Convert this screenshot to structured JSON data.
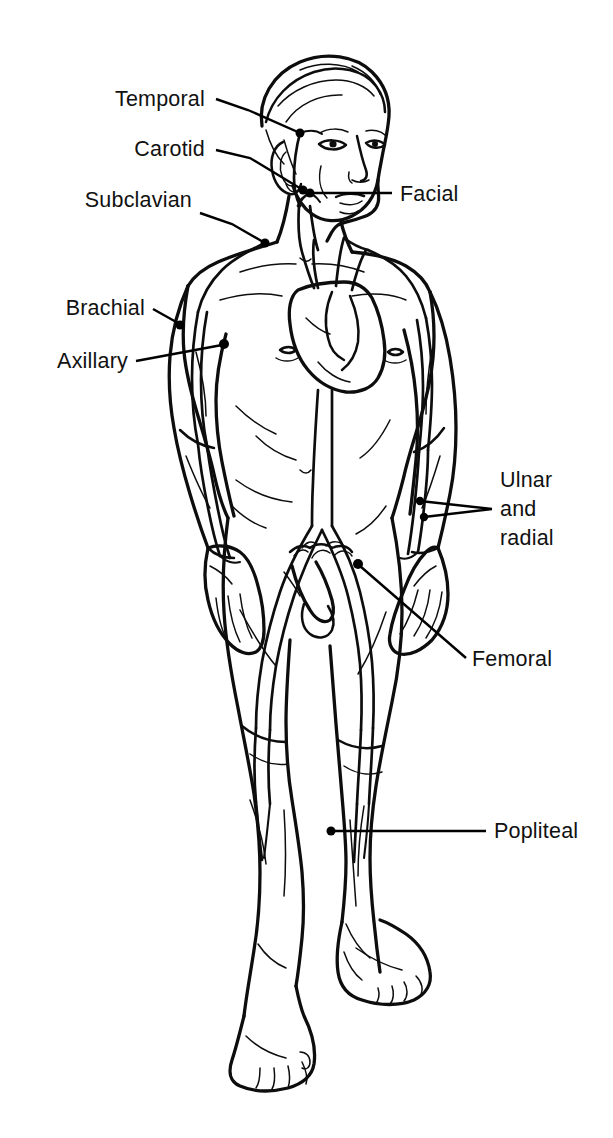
{
  "figure": {
    "background_color": "#ffffff",
    "line_color": "#0d0d0d",
    "label_color": "#111111"
  },
  "labels": [
    {
      "id": "temporal",
      "text": "Temporal",
      "side": "left",
      "text_x": 205,
      "text_y": 106,
      "anchor": "end",
      "leader": "M 216 99 L 248 110 L 300 133",
      "dot_x": 300,
      "dot_y": 133,
      "dot_r": 4.5
    },
    {
      "id": "carotid",
      "text": "Carotid",
      "side": "left",
      "text_x": 205,
      "text_y": 156,
      "anchor": "end",
      "leader": "M 216 150 L 250 158 L 303 190",
      "dot_x": 303,
      "dot_y": 190,
      "dot_r": 4.5
    },
    {
      "id": "facial",
      "text": "Facial",
      "side": "right",
      "text_x": 400,
      "text_y": 201,
      "anchor": "start",
      "leader": "M 392 193 L 310 193",
      "dot_x": 310,
      "dot_y": 193,
      "dot_r": 4.5
    },
    {
      "id": "subclavian",
      "text": "Subclavian",
      "side": "left",
      "text_x": 192,
      "text_y": 207,
      "anchor": "end",
      "leader": "M 200 213 L 232 224 L 265 243",
      "dot_x": 265,
      "dot_y": 243,
      "dot_r": 4.5
    },
    {
      "id": "brachial",
      "text": "Brachial",
      "side": "left",
      "text_x": 145,
      "text_y": 315,
      "anchor": "end",
      "leader": "M 153 309 L 178 323",
      "dot_x": 180,
      "dot_y": 325,
      "dot_r": 4.5
    },
    {
      "id": "axillary",
      "text": "Axillary",
      "side": "left",
      "text_x": 128,
      "text_y": 368,
      "anchor": "end",
      "leader": "M 136 361 L 222 345",
      "dot_x": 224,
      "dot_y": 344,
      "dot_r": 5.0
    },
    {
      "id": "ulnar-radial",
      "text": "Ulnar\nand\nradial",
      "lines": [
        "Ulnar",
        "and",
        "radial"
      ],
      "side": "right",
      "text_x": 500,
      "text_y": 487,
      "line_height": 29,
      "anchor": "start",
      "leader": "M 492 509 L 420 501 M 492 509 L 424 517",
      "dot_x": 420,
      "dot_y": 501,
      "dot_r": 4.2,
      "dot2_x": 424,
      "dot2_y": 517,
      "dot2_r": 4.2
    },
    {
      "id": "femoral",
      "text": "Femoral",
      "side": "right",
      "text_x": 472,
      "text_y": 666,
      "anchor": "start",
      "leader": "M 466 658 L 360 566",
      "dot_x": 358,
      "dot_y": 564,
      "dot_r": 5.0
    },
    {
      "id": "popliteal",
      "text": "Popliteal",
      "side": "right",
      "text_x": 494,
      "text_y": 838,
      "anchor": "start",
      "leader": "M 486 831 L 331 831",
      "dot_x": 331,
      "dot_y": 831,
      "dot_r": 4.5
    }
  ],
  "arteries": [
    "temporal",
    "carotid",
    "facial",
    "subclavian",
    "brachial",
    "axillary",
    "ulnar",
    "radial",
    "femoral",
    "popliteal",
    "aorta",
    "iliac"
  ]
}
